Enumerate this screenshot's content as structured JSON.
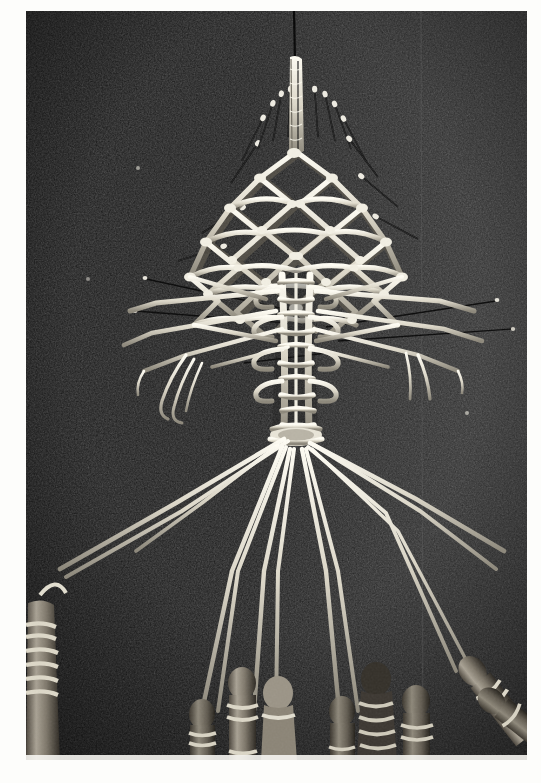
{
  "image": {
    "kind": "photograph",
    "subject": "macrame-lace-work-in-progress-on-dark-cushion",
    "orientation": "portrait",
    "medium": "black-and-white halftone print photograph",
    "page_background_color": "#fdfdfb",
    "photo": {
      "x": 26,
      "y": 11,
      "width": 501,
      "height": 749,
      "background_color_left": "#141414",
      "background_color_right": "#2b2b2b",
      "cord_color": "#e6e2d6",
      "cord_shadow_color": "#8e897c",
      "pin_color": "#0a0a0a",
      "pin_head_color": "#efece2",
      "bobbin_color": "#9a9486",
      "bobbin_dark_color": "#3a352e",
      "seam_line_x": 395,
      "seam_line_color": "#4a4a4a"
    },
    "regions": [
      {
        "name": "hanging-cord",
        "description": "single braided cord descending from top of frame, pinned with a dark needle"
      },
      {
        "name": "diamond-lattice-net",
        "description": "open knotted diamond mesh forming a fan shaped bodice"
      },
      {
        "name": "central-braid-band",
        "description": "dense vertical ladder-like braided band below the lattice"
      },
      {
        "name": "pin-fan-top",
        "description": "row of straight pins radiating upward and outward with bright heads"
      },
      {
        "name": "left-arm-cords",
        "description": "cords stretched to the left with loose curling ends"
      },
      {
        "name": "right-arm-cords",
        "description": "cords stretched to the right with loose ends"
      },
      {
        "name": "fanned-working-cords",
        "description": "long cords fanning downward from the waist toward the bobbins"
      },
      {
        "name": "bobbin-row",
        "description": "row of wooden bobbins with thread wound around their necks at the bottom edge"
      }
    ],
    "counts": {
      "pins_visible": 14,
      "bobbins_visible": 9,
      "lattice_rows": 6,
      "fanned_cords": 12
    }
  }
}
